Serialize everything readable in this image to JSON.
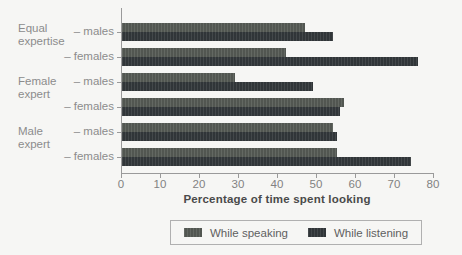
{
  "chart_data": {
    "type": "bar",
    "orientation": "horizontal",
    "title": "",
    "xlabel": "Percentage of time spent looking",
    "ylabel": "",
    "xlim": [
      0,
      80
    ],
    "xticks": [
      0,
      10,
      20,
      30,
      40,
      50,
      60,
      70,
      80
    ],
    "grid": false,
    "legend_position": "bottom",
    "group_labels": [
      {
        "lines": [
          "Equal",
          "expertise"
        ]
      },
      {
        "lines": [
          "Female",
          "expert"
        ]
      },
      {
        "lines": [
          "Male",
          "expert"
        ]
      }
    ],
    "categories": [
      "– males",
      "– females",
      "– males",
      "– females",
      "– males",
      "– females"
    ],
    "series": [
      {
        "name": "While speaking",
        "color": "#565b55",
        "values": [
          47,
          42,
          29,
          57,
          54,
          55
        ]
      },
      {
        "name": "While listening",
        "color": "#33383b",
        "values": [
          54,
          76,
          49,
          56,
          55,
          74
        ]
      }
    ]
  },
  "colors": {
    "background": "#f6f6f4",
    "axis": "#9a9a9a",
    "category_text": "#8c8c8c",
    "tick_text": "#828282",
    "axis_title_text": "#4a4a4a",
    "legend_border": "#b0b0b0"
  }
}
